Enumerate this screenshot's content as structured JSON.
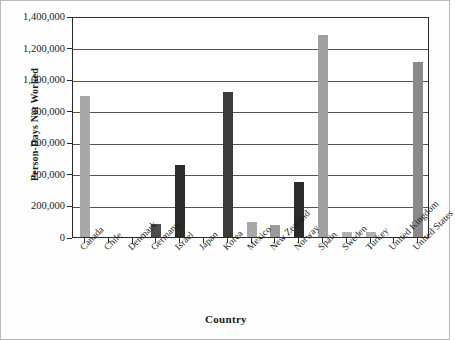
{
  "chart_data": {
    "type": "bar",
    "title": "",
    "xlabel": "Country",
    "ylabel": "Person-Days Not Worked",
    "ylim": [
      0,
      1400000
    ],
    "ytick_labels": [
      "0",
      "200,000",
      "400,000",
      "600,000",
      "800,000",
      "1,000,000",
      "1,200,000",
      "1,400,000"
    ],
    "ytick_values": [
      0,
      200000,
      400000,
      600000,
      800000,
      1000000,
      1200000,
      1400000
    ],
    "grid": true,
    "legend": "none",
    "categories": [
      "Canada",
      "Chile",
      "Denmark",
      "Germany",
      "Israel",
      "Japan",
      "Korea",
      "Mexico",
      "New Zealand",
      "Norway",
      "Spain",
      "Sweden",
      "Turkey",
      "United Kingdom",
      "United States"
    ],
    "values": [
      895000,
      0,
      0,
      80000,
      455000,
      0,
      920000,
      95000,
      75000,
      350000,
      1280000,
      30000,
      30000,
      0,
      1110000
    ],
    "bar_colors": [
      "#a8a8a8",
      "#a8a8a8",
      "#a8a8a8",
      "#4d4d4d",
      "#2b2b2b",
      "#a8a8a8",
      "#3c3c3c",
      "#a8a8a8",
      "#9a9a9a",
      "#2b2b2b",
      "#a0a0a0",
      "#b0b0b0",
      "#b0b0b0",
      "#a8a8a8",
      "#8a8a8a"
    ],
    "axis_color": "#2a2a2a",
    "gridline_color": "#555555",
    "background_color": "#ffffff"
  }
}
